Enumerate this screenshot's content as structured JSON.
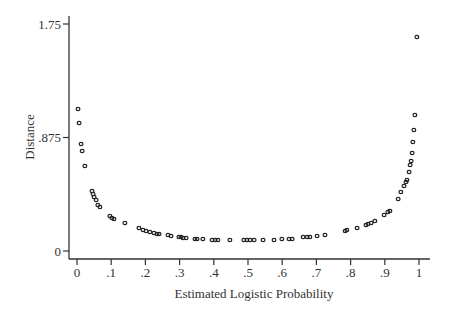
{
  "chart_data": {
    "type": "scatter",
    "title": "",
    "xlabel": "Estimated Logistic Probability",
    "ylabel": "Distance",
    "xlim": [
      0,
      1
    ],
    "ylim": [
      0,
      1.75
    ],
    "grid": false,
    "legend": null,
    "x_ticks": [
      0,
      0.1,
      0.2,
      0.3,
      0.4,
      0.5,
      0.6,
      0.7,
      0.8,
      0.9,
      1
    ],
    "x_tick_labels": [
      "0",
      ".1",
      ".2",
      ".3",
      ".4",
      ".5",
      ".6",
      ".7",
      ".8",
      ".9",
      "1"
    ],
    "y_ticks": [
      0,
      0.875,
      1.75
    ],
    "y_tick_labels": [
      "0",
      ".875",
      "1.75"
    ],
    "marker": "hollow-circle",
    "points": [
      [
        0.003,
        1.095
      ],
      [
        0.006,
        0.987
      ],
      [
        0.012,
        0.825
      ],
      [
        0.015,
        0.771
      ],
      [
        0.023,
        0.655
      ],
      [
        0.044,
        0.463
      ],
      [
        0.047,
        0.439
      ],
      [
        0.05,
        0.416
      ],
      [
        0.056,
        0.393
      ],
      [
        0.061,
        0.355
      ],
      [
        0.067,
        0.339
      ],
      [
        0.096,
        0.27
      ],
      [
        0.102,
        0.254
      ],
      [
        0.108,
        0.247
      ],
      [
        0.14,
        0.216
      ],
      [
        0.181,
        0.177
      ],
      [
        0.193,
        0.162
      ],
      [
        0.202,
        0.154
      ],
      [
        0.213,
        0.146
      ],
      [
        0.225,
        0.139
      ],
      [
        0.234,
        0.131
      ],
      [
        0.24,
        0.131
      ],
      [
        0.266,
        0.123
      ],
      [
        0.275,
        0.116
      ],
      [
        0.298,
        0.108
      ],
      [
        0.304,
        0.108
      ],
      [
        0.31,
        0.1
      ],
      [
        0.319,
        0.1
      ],
      [
        0.345,
        0.093
      ],
      [
        0.351,
        0.093
      ],
      [
        0.368,
        0.093
      ],
      [
        0.395,
        0.085
      ],
      [
        0.404,
        0.085
      ],
      [
        0.412,
        0.085
      ],
      [
        0.447,
        0.085
      ],
      [
        0.488,
        0.085
      ],
      [
        0.497,
        0.085
      ],
      [
        0.506,
        0.085
      ],
      [
        0.518,
        0.085
      ],
      [
        0.544,
        0.085
      ],
      [
        0.576,
        0.085
      ],
      [
        0.599,
        0.093
      ],
      [
        0.62,
        0.093
      ],
      [
        0.629,
        0.093
      ],
      [
        0.661,
        0.108
      ],
      [
        0.673,
        0.108
      ],
      [
        0.681,
        0.108
      ],
      [
        0.702,
        0.116
      ],
      [
        0.725,
        0.123
      ],
      [
        0.784,
        0.154
      ],
      [
        0.789,
        0.162
      ],
      [
        0.819,
        0.177
      ],
      [
        0.845,
        0.2
      ],
      [
        0.851,
        0.208
      ],
      [
        0.86,
        0.216
      ],
      [
        0.871,
        0.231
      ],
      [
        0.898,
        0.278
      ],
      [
        0.909,
        0.301
      ],
      [
        0.915,
        0.308
      ],
      [
        0.939,
        0.401
      ],
      [
        0.947,
        0.455
      ],
      [
        0.956,
        0.501
      ],
      [
        0.962,
        0.532
      ],
      [
        0.965,
        0.547
      ],
      [
        0.971,
        0.609
      ],
      [
        0.974,
        0.663
      ],
      [
        0.977,
        0.694
      ],
      [
        0.98,
        0.755
      ],
      [
        0.982,
        0.84
      ],
      [
        0.985,
        0.933
      ],
      [
        0.988,
        1.048
      ],
      [
        0.994,
        1.65
      ]
    ]
  },
  "layout": {
    "x_px_at_0": 77,
    "x_px_at_1": 419,
    "y_px_at_0": 251,
    "y_px_at_max": 24,
    "y_axis_x": 69,
    "x_axis_y": 259,
    "y_axis_top": 16,
    "x_axis_right": 430
  }
}
